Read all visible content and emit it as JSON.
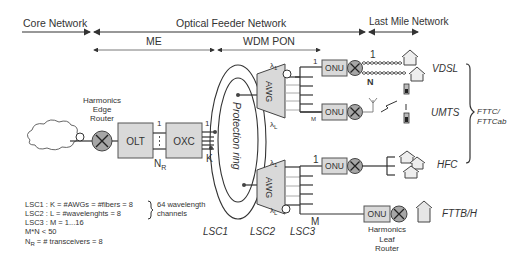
{
  "header": {
    "core_network": "Core Network",
    "optical_feeder_network": "Optical Feeder Network",
    "last_mile_network": "Last Mile Network",
    "me": "ME",
    "wdm_pon": "WDM PON"
  },
  "nodes": {
    "edge_router_line1": "Harmonics",
    "edge_router_line2": "Edge",
    "edge_router_line3": "Router",
    "olt": "OLT",
    "oxc": "OXC",
    "protection_ring": "Protection ring",
    "awg_top": "AWG",
    "awg_bottom": "AWG",
    "onu_1": "ONU",
    "onu_2": "ONU",
    "onu_3": "ONU",
    "onu_4": "ONU",
    "leaf_router_line1": "Harmonics",
    "leaf_router_line2": "Leaf",
    "leaf_router_line3": "Router"
  },
  "ports": {
    "olt_1": "1",
    "olt_nr": "N",
    "olt_nr_sub": "R",
    "oxc_1": "1",
    "oxc_k": "K",
    "lambda_1": "λ",
    "lambda_1_sub": "1",
    "lambda_l": "λ",
    "lambda_l_sub": "L",
    "split_top_1": "1",
    "split_top_m": "M",
    "split_bot_1": "1",
    "split_bot_m": "M",
    "vdsl_1": "1",
    "vdsl_n": "N"
  },
  "access": {
    "vdsl": "VDSL",
    "umts": "UMTS",
    "hfc": "HFC",
    "fttb": "FTTB/H",
    "fttc_line1": "FTTC/",
    "fttc_line2": "FTTCab"
  },
  "stages": {
    "lsc1": "LSC1",
    "lsc2": "LSC2",
    "lsc3": "LSC3"
  },
  "legend": {
    "line1": "LSC1 : K = #AWGs =  #fibers = 8",
    "line2": "LSC2 : L = #wavelenghts = 8",
    "line3": "LSC3 : M = 1...16",
    "line4": "M*N < 50",
    "line5_main": "N",
    "line5_sub": "R",
    "line5_rest": " = # transceivers = 8",
    "channels_line1": "64 wavelength",
    "channels_line2": "channels"
  }
}
